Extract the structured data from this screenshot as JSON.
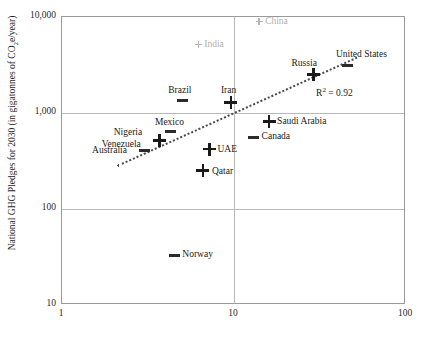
{
  "chart_data": {
    "type": "scatter",
    "title": "",
    "xlabel": "",
    "ylabel": "National GHG Pledges for 2030 (in gigatonnes of CO2e/year)",
    "xscale": "log",
    "yscale": "log",
    "xlim": [
      1,
      100
    ],
    "ylim": [
      10,
      10000
    ],
    "xticks": [
      "1",
      "10",
      "100"
    ],
    "yticks": [
      "10,000",
      "1,000",
      "100",
      "10"
    ],
    "grid": true,
    "annotation": "R2 = 0.92",
    "annotation_r2_prefix": "R",
    "annotation_r2_sup": "2",
    "annotation_r2_value": " = 0.92",
    "trendline": true,
    "points": [
      {
        "label": "China",
        "x": 14.0,
        "y": 9000,
        "marker": "plus-small",
        "style": "gray",
        "label_dx": 6,
        "label_dy": -5
      },
      {
        "label": "India",
        "x": 6.2,
        "y": 5200,
        "marker": "plus-small",
        "style": "gray",
        "label_dx": 6,
        "label_dy": -5
      },
      {
        "label": "United States",
        "x": 46.0,
        "y": 3150,
        "marker": "dash",
        "style": "dark",
        "label_dx": -12,
        "label_dy": -16
      },
      {
        "label": "Russia",
        "x": 29.0,
        "y": 2500,
        "marker": "plus",
        "style": "dark",
        "label_dx": -22,
        "label_dy": -17
      },
      {
        "label": "Brazil",
        "x": 5.0,
        "y": 1350,
        "marker": "dash",
        "style": "dark",
        "label_dx": -14,
        "label_dy": -15
      },
      {
        "label": "Iran",
        "x": 9.6,
        "y": 1280,
        "marker": "plus",
        "style": "dark",
        "label_dx": -10,
        "label_dy": -18
      },
      {
        "label": "Saudi Arabia",
        "x": 16.0,
        "y": 810,
        "marker": "plus",
        "style": "dark",
        "label_dx": 8,
        "label_dy": -6
      },
      {
        "label": "Canada",
        "x": 13.0,
        "y": 560,
        "marker": "dash",
        "style": "dark",
        "label_dx": 8,
        "label_dy": -6
      },
      {
        "label": "Mexico",
        "x": 4.3,
        "y": 640,
        "marker": "dash",
        "style": "dark",
        "label_dx": -16,
        "label_dy": -15
      },
      {
        "label": "Nigeria",
        "x": 3.7,
        "y": 520,
        "marker": "plus",
        "style": "dark",
        "label_dx": -46,
        "label_dy": -13
      },
      {
        "label": "Venezuela",
        "x": 3.7,
        "y": 480,
        "marker": "none",
        "style": "dark",
        "label_dx": -58,
        "label_dy": -5
      },
      {
        "label": "Australia",
        "x": 3.0,
        "y": 410,
        "marker": "dash",
        "style": "dark",
        "label_dx": -52,
        "label_dy": -5
      },
      {
        "label": "UAE",
        "x": 7.2,
        "y": 420,
        "marker": "plus",
        "style": "dark",
        "label_dx": 8,
        "label_dy": -5
      },
      {
        "label": "Qatar",
        "x": 6.6,
        "y": 250,
        "marker": "plus",
        "style": "dark",
        "label_dx": 9,
        "label_dy": -5
      },
      {
        "label": "Norway",
        "x": 4.5,
        "y": 33,
        "marker": "dash",
        "style": "dark",
        "label_dx": 8,
        "label_dy": -6
      }
    ]
  }
}
